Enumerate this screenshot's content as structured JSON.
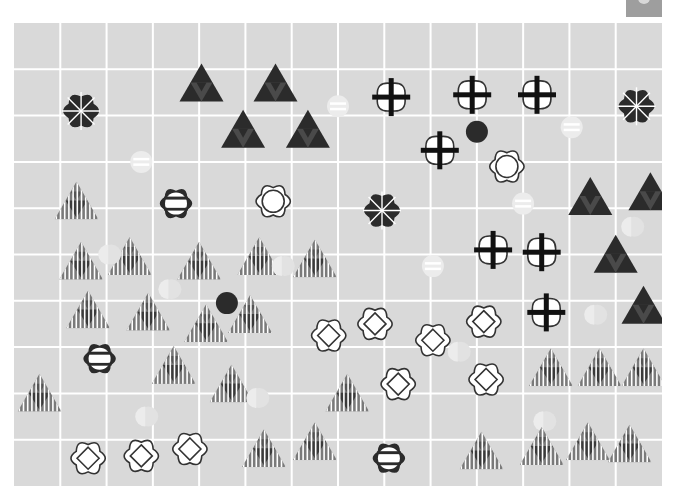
{
  "header": {
    "title": ""
  },
  "corner_button": {
    "icon": "corner-icon",
    "label": ""
  },
  "board": {
    "columns": 14,
    "rows": 10,
    "colors": {
      "background": "#d9d9d9",
      "grid_line": "#ffffff",
      "dark": "#2b2b2b",
      "dark_mid": "#4a4a4a",
      "stripe": "#7a7a7a",
      "stripe_dark": "#3a3a3a",
      "white": "#ffffff",
      "outline": "#333333",
      "faint": "#ececec",
      "faint2": "#e2e2e2"
    },
    "pieces": [
      {
        "type": "dark-asterisk-flower",
        "col": 0.95,
        "row": 1.4
      },
      {
        "type": "dark-triangle",
        "col": 3.55,
        "row": 0.85
      },
      {
        "type": "dark-triangle",
        "col": 5.15,
        "row": 0.85
      },
      {
        "type": "dark-triangle",
        "col": 4.45,
        "row": 1.85
      },
      {
        "type": "dark-triangle",
        "col": 5.85,
        "row": 1.85
      },
      {
        "type": "faint-striped-circle",
        "col": 6.5,
        "row": 1.3
      },
      {
        "type": "faint-striped-circle",
        "col": 2.25,
        "row": 2.5
      },
      {
        "type": "white-cross-flower",
        "col": 7.65,
        "row": 1.1
      },
      {
        "type": "white-cross-flower",
        "col": 9.4,
        "row": 1.05
      },
      {
        "type": "white-cross-flower",
        "col": 10.8,
        "row": 1.05
      },
      {
        "type": "dark-asterisk-flower",
        "col": 12.95,
        "row": 1.3
      },
      {
        "type": "faint-striped-circle",
        "col": 11.55,
        "row": 1.75
      },
      {
        "type": "white-cross-flower",
        "col": 8.7,
        "row": 2.25
      },
      {
        "type": "dark-dot",
        "col": 9.5,
        "row": 1.85
      },
      {
        "type": "white-ring-flower",
        "col": 10.15,
        "row": 2.6
      },
      {
        "type": "striped-triangle",
        "col": 0.85,
        "row": 3.4
      },
      {
        "type": "dark-bar-flower",
        "col": 3.0,
        "row": 3.4
      },
      {
        "type": "white-ring-flower",
        "col": 5.1,
        "row": 3.35
      },
      {
        "type": "dark-asterisk-flower",
        "col": 7.45,
        "row": 3.55
      },
      {
        "type": "faint-striped-circle",
        "col": 10.5,
        "row": 3.4
      },
      {
        "type": "dark-triangle",
        "col": 11.95,
        "row": 3.3
      },
      {
        "type": "dark-triangle",
        "col": 13.25,
        "row": 3.2
      },
      {
        "type": "faint-half-circle",
        "col": 12.9,
        "row": 3.9
      },
      {
        "type": "striped-triangle",
        "col": 0.95,
        "row": 4.7
      },
      {
        "type": "striped-triangle",
        "col": 2.0,
        "row": 4.6
      },
      {
        "type": "faint-half-circle",
        "col": 1.6,
        "row": 4.5
      },
      {
        "type": "striped-triangle",
        "col": 3.5,
        "row": 4.7
      },
      {
        "type": "striped-triangle",
        "col": 4.8,
        "row": 4.6
      },
      {
        "type": "faint-half-circle",
        "col": 5.35,
        "row": 4.75
      },
      {
        "type": "striped-triangle",
        "col": 6.0,
        "row": 4.65
      },
      {
        "type": "faint-striped-circle",
        "col": 8.55,
        "row": 4.75
      },
      {
        "type": "white-cross-flower",
        "col": 9.85,
        "row": 4.4
      },
      {
        "type": "white-cross-flower",
        "col": 10.9,
        "row": 4.45
      },
      {
        "type": "dark-triangle",
        "col": 12.5,
        "row": 4.55
      },
      {
        "type": "faint-half-circle",
        "col": 2.9,
        "row": 5.25
      },
      {
        "type": "dark-dot",
        "col": 4.1,
        "row": 5.55
      },
      {
        "type": "striped-triangle",
        "col": 1.1,
        "row": 5.75
      },
      {
        "type": "striped-triangle",
        "col": 2.4,
        "row": 5.8
      },
      {
        "type": "striped-triangle",
        "col": 3.65,
        "row": 6.05
      },
      {
        "type": "striped-triangle",
        "col": 4.6,
        "row": 5.85
      },
      {
        "type": "white-cross-flower",
        "col": 11.0,
        "row": 5.75
      },
      {
        "type": "dark-triangle",
        "col": 13.1,
        "row": 5.65
      },
      {
        "type": "faint-half-circle",
        "col": 12.1,
        "row": 5.8
      },
      {
        "type": "white-diamond-flower",
        "col": 6.3,
        "row": 6.25
      },
      {
        "type": "white-diamond-flower",
        "col": 7.3,
        "row": 6.0
      },
      {
        "type": "white-diamond-flower",
        "col": 8.55,
        "row": 6.35
      },
      {
        "type": "white-diamond-flower",
        "col": 9.65,
        "row": 5.95
      },
      {
        "type": "faint-half-circle",
        "col": 9.15,
        "row": 6.6
      },
      {
        "type": "dark-bar-flower",
        "col": 1.35,
        "row": 6.75
      },
      {
        "type": "striped-triangle",
        "col": 2.95,
        "row": 6.95
      },
      {
        "type": "white-diamond-flower",
        "col": 7.8,
        "row": 7.3
      },
      {
        "type": "white-diamond-flower",
        "col": 9.7,
        "row": 7.2
      },
      {
        "type": "striped-triangle",
        "col": 11.1,
        "row": 7.0
      },
      {
        "type": "striped-triangle",
        "col": 12.15,
        "row": 7.0
      },
      {
        "type": "striped-triangle",
        "col": 13.1,
        "row": 7.0
      },
      {
        "type": "striped-triangle",
        "col": 4.2,
        "row": 7.35
      },
      {
        "type": "faint-half-circle",
        "col": 4.8,
        "row": 7.6
      },
      {
        "type": "striped-triangle",
        "col": 6.7,
        "row": 7.55
      },
      {
        "type": "faint-half-circle",
        "col": 2.4,
        "row": 8.0
      },
      {
        "type": "striped-triangle",
        "col": 0.05,
        "row": 7.55
      },
      {
        "type": "faint-half-circle",
        "col": 11.0,
        "row": 8.1
      },
      {
        "type": "white-diamond-flower",
        "col": 1.1,
        "row": 8.9
      },
      {
        "type": "white-diamond-flower",
        "col": 2.25,
        "row": 8.85
      },
      {
        "type": "white-diamond-flower",
        "col": 3.3,
        "row": 8.7
      },
      {
        "type": "striped-triangle",
        "col": 4.9,
        "row": 8.75
      },
      {
        "type": "striped-triangle",
        "col": 6.0,
        "row": 8.6
      },
      {
        "type": "dark-bar-flower",
        "col": 7.6,
        "row": 8.9
      },
      {
        "type": "striped-triangle",
        "col": 9.6,
        "row": 8.8
      },
      {
        "type": "striped-triangle",
        "col": 10.9,
        "row": 8.7
      },
      {
        "type": "striped-triangle",
        "col": 11.9,
        "row": 8.6
      },
      {
        "type": "striped-triangle",
        "col": 12.8,
        "row": 8.65
      }
    ]
  }
}
